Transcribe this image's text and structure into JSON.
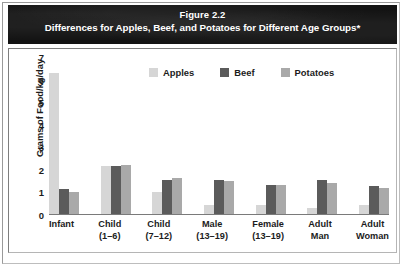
{
  "figure": {
    "number_label": "Figure 2.2",
    "caption": "Differences for Apples, Beef, and Potatoes for Different Age Groups*"
  },
  "colors": {
    "apples": "#d6d6d6",
    "beef": "#5b5b5b",
    "potatoes": "#a9a9a9",
    "banner_background": "#131313",
    "banner_text": "#ffffff",
    "frame_border": "#7e7e7e",
    "axis_text": "#1c1c1c"
  },
  "chart_data": {
    "type": "bar",
    "title": "Figure 2.2",
    "subtitle": "Differences for Apples, Beef, and Potatoes for Different Age Groups*",
    "xlabel": "",
    "ylabel": "Grams of Food/kg/day",
    "ylim": [
      0,
      7
    ],
    "yticks": [
      0,
      1,
      2,
      3,
      4,
      5,
      6,
      7
    ],
    "ytick_labels": [
      "0",
      "1",
      "2",
      "3",
      "4",
      "5",
      "6",
      "7"
    ],
    "grid": false,
    "legend_position": "top-center",
    "categories": [
      "Infant",
      "Child (1–6)",
      "Child (7–12)",
      "Male (13–19)",
      "Female (13–19)",
      "Adult Man",
      "Adult Woman"
    ],
    "category_lines": [
      [
        "Infant",
        ""
      ],
      [
        "Child",
        "(1–6)"
      ],
      [
        "Child",
        "(7–12)"
      ],
      [
        "Male",
        "(13–19)"
      ],
      [
        "Female",
        "(13–19)"
      ],
      [
        "Adult",
        "Man"
      ],
      [
        "Adult",
        "Woman"
      ]
    ],
    "series": [
      {
        "name": "Apples",
        "key": "apples",
        "color": "#d6d6d6",
        "values": [
          6.3,
          2.15,
          1.0,
          0.45,
          0.45,
          0.3,
          0.45
        ]
      },
      {
        "name": "Beef",
        "key": "beef",
        "color": "#5b5b5b",
        "values": [
          1.15,
          2.15,
          1.55,
          1.55,
          1.35,
          1.55,
          1.3
        ]
      },
      {
        "name": "Potatoes",
        "key": "potatoes",
        "color": "#a9a9a9",
        "values": [
          1.0,
          2.2,
          1.65,
          1.5,
          1.35,
          1.4,
          1.2
        ]
      }
    ]
  }
}
